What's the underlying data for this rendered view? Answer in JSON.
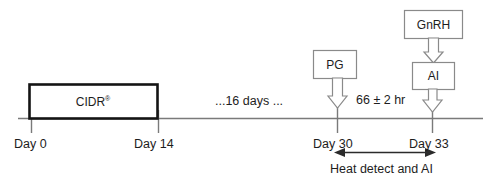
{
  "diagram": {
    "title_semantic": "cidr-estrus-synchronization-protocol-timeline",
    "timeline": {
      "gap_label": "...16 days ...",
      "interval_label": "66 ± 2 hr",
      "ticks": [
        {
          "id": "day0",
          "label": "Day 0",
          "x": 31
        },
        {
          "id": "day14",
          "label": "Day 14",
          "x": 158
        },
        {
          "id": "day30",
          "label": "Day 30",
          "x": 337
        },
        {
          "id": "day33",
          "label": "Day 33",
          "x": 432
        }
      ]
    },
    "treatment_box": {
      "label": "CIDR",
      "superscript": "®"
    },
    "event_boxes": [
      {
        "id": "pg",
        "label": "PG"
      },
      {
        "id": "gnrh",
        "label": "GnRH"
      },
      {
        "id": "ai",
        "label": "AI"
      }
    ],
    "span_annotation": {
      "label": "Heat detect and AI"
    },
    "colors": {
      "line": "#7a7a7a",
      "box_stroke": "#8a8a8a",
      "cidr_stroke": "#141414",
      "text": "#1d1d1d",
      "arrow": "#2b2b2b",
      "background": "#ffffff"
    }
  }
}
